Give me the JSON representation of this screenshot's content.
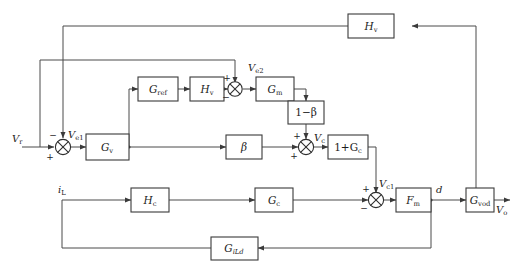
{
  "diagram": {
    "type": "block-diagram",
    "colors": {
      "wire": "#4a4a4a",
      "block_stroke": "#3a3a3a",
      "text": "#1c1c1c",
      "background": "#ffffff"
    }
  },
  "blocks": [
    {
      "id": "hv_top",
      "label": "H",
      "sub": "v",
      "sub_italic": false
    },
    {
      "id": "gref",
      "label": "G",
      "sub": "ref",
      "sub_italic": false
    },
    {
      "id": "hv_mid",
      "label": "H",
      "sub": "v",
      "sub_italic": false
    },
    {
      "id": "gm",
      "label": "G",
      "sub": "m",
      "sub_italic": false
    },
    {
      "id": "one_beta",
      "label": "1−β",
      "sub": "",
      "sub_italic": false
    },
    {
      "id": "gv",
      "label": "G",
      "sub": "v",
      "sub_italic": false
    },
    {
      "id": "beta",
      "label": "β",
      "sub": "",
      "sub_italic": false
    },
    {
      "id": "one_gc",
      "label": "1+G",
      "sub": "c",
      "sub_italic": false
    },
    {
      "id": "hc",
      "label": "H",
      "sub": "c",
      "sub_italic": false
    },
    {
      "id": "gc",
      "label": "G",
      "sub": "c",
      "sub_italic": false
    },
    {
      "id": "fm",
      "label": "F",
      "sub": "m",
      "sub_italic": false
    },
    {
      "id": "gvod",
      "label": "G",
      "sub": "vod",
      "sub_italic": false
    },
    {
      "id": "gild",
      "label": "G",
      "sub": "iLd",
      "sub_italic": true
    }
  ],
  "signals": [
    {
      "id": "vr",
      "label": "V",
      "sub": "r",
      "desc": "reference voltage input"
    },
    {
      "id": "ve1",
      "label": "V",
      "sub": "e1",
      "desc": "voltage error 1"
    },
    {
      "id": "ve2",
      "label": "V",
      "sub": "e2",
      "desc": "voltage error 2"
    },
    {
      "id": "vc",
      "label": "V",
      "sub": "c",
      "desc": "control voltage"
    },
    {
      "id": "vc1",
      "label": "V",
      "sub": "c1",
      "desc": "control voltage 1"
    },
    {
      "id": "il",
      "label": "i",
      "sub": "L",
      "desc": "inductor current"
    },
    {
      "id": "d",
      "label": "d",
      "sub": "",
      "desc": "duty ratio"
    },
    {
      "id": "vo",
      "label": "V",
      "sub": "o",
      "desc": "output voltage"
    }
  ],
  "summing_junctions": [
    {
      "id": "sum_main",
      "desc": "main voltage error summer",
      "signs": {
        "left": "+",
        "top": "−"
      }
    },
    {
      "id": "sum_mid",
      "desc": "reference path summer",
      "signs": {
        "left": "−",
        "top": "+"
      }
    },
    {
      "id": "sum_vc",
      "desc": "control voltage summer",
      "signs": {
        "left": "+",
        "top": "+"
      }
    },
    {
      "id": "sum_inner",
      "desc": "inner current loop summer",
      "signs": {
        "left": "−",
        "top": "+"
      }
    }
  ]
}
